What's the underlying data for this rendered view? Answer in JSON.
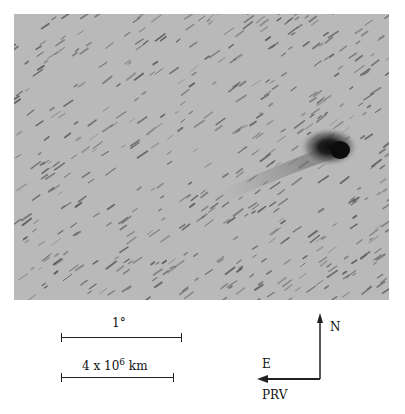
{
  "figure": {
    "scale_bars": [
      {
        "label": "1°"
      },
      {
        "label_base": "4 x 10",
        "label_exp": "6",
        "label_unit": " km"
      }
    ],
    "compass": {
      "north_label": "N",
      "east_label": "E",
      "vector_label": "PRV"
    },
    "colors": {
      "sky": "#b9b9b9",
      "streak": "#555555",
      "nucleus": "#111111",
      "ink": "#222222"
    }
  }
}
